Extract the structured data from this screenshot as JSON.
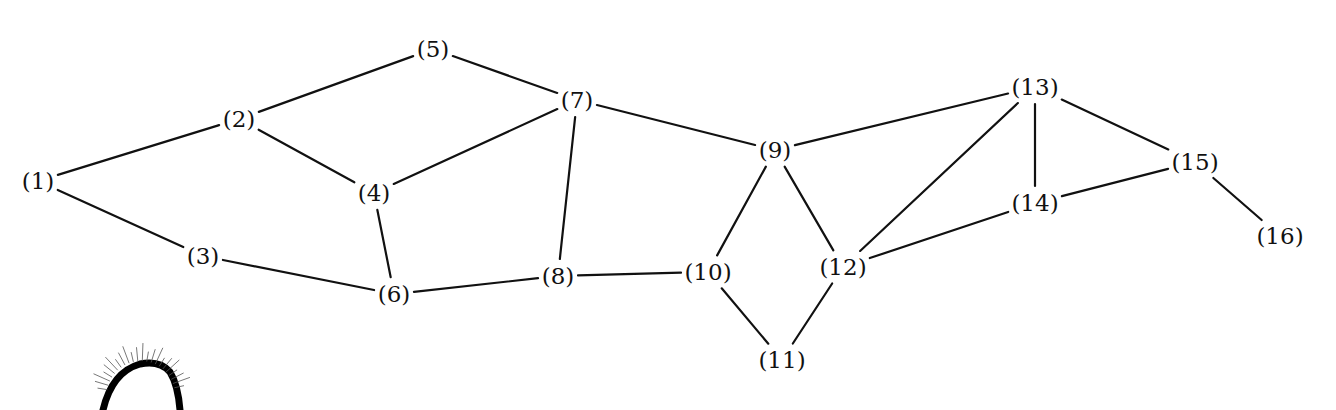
{
  "diagram": {
    "type": "undirected-graph",
    "nodes": [
      {
        "id": 1,
        "label": "(1)",
        "x": 38,
        "y": 181
      },
      {
        "id": 2,
        "label": "(2)",
        "x": 239,
        "y": 119
      },
      {
        "id": 3,
        "label": "(3)",
        "x": 203,
        "y": 256
      },
      {
        "id": 4,
        "label": "(4)",
        "x": 374,
        "y": 193
      },
      {
        "id": 5,
        "label": "(5)",
        "x": 433,
        "y": 49
      },
      {
        "id": 6,
        "label": "(6)",
        "x": 394,
        "y": 294
      },
      {
        "id": 7,
        "label": "(7)",
        "x": 577,
        "y": 100
      },
      {
        "id": 8,
        "label": "(8)",
        "x": 558,
        "y": 276
      },
      {
        "id": 9,
        "label": "(9)",
        "x": 775,
        "y": 150
      },
      {
        "id": 10,
        "label": "(10)",
        "x": 708,
        "y": 272
      },
      {
        "id": 11,
        "label": "(11)",
        "x": 782,
        "y": 360
      },
      {
        "id": 12,
        "label": "(12)",
        "x": 843,
        "y": 267
      },
      {
        "id": 13,
        "label": "(13)",
        "x": 1035,
        "y": 87
      },
      {
        "id": 14,
        "label": "(14)",
        "x": 1035,
        "y": 203
      },
      {
        "id": 15,
        "label": "(15)",
        "x": 1195,
        "y": 162
      },
      {
        "id": 16,
        "label": "(16)",
        "x": 1280,
        "y": 236
      }
    ],
    "edges": [
      [
        1,
        2
      ],
      [
        1,
        3
      ],
      [
        2,
        5
      ],
      [
        2,
        4
      ],
      [
        3,
        6
      ],
      [
        4,
        7
      ],
      [
        4,
        6
      ],
      [
        5,
        7
      ],
      [
        6,
        8
      ],
      [
        7,
        8
      ],
      [
        7,
        9
      ],
      [
        8,
        10
      ],
      [
        9,
        10
      ],
      [
        9,
        12
      ],
      [
        9,
        13
      ],
      [
        10,
        11
      ],
      [
        11,
        12
      ],
      [
        12,
        13
      ],
      [
        12,
        14
      ],
      [
        13,
        14
      ],
      [
        13,
        15
      ],
      [
        14,
        15
      ],
      [
        15,
        16
      ]
    ],
    "colors": {
      "line": "#111111",
      "text": "#111111",
      "background": "#ffffff"
    }
  }
}
